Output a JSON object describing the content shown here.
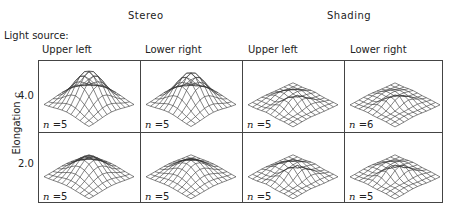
{
  "groups": [
    {
      "title": "Stereo"
    },
    {
      "title": "Shading"
    }
  ],
  "light_source_label": "Light source:",
  "columns": [
    {
      "label": "Upper left",
      "group": "Stereo"
    },
    {
      "label": "Lower right",
      "group": "Stereo"
    },
    {
      "label": "Upper left",
      "group": "Shading"
    },
    {
      "label": "Lower right",
      "group": "Shading"
    }
  ],
  "y_axis": {
    "label": "Elongation c",
    "label_text": "Elongation ",
    "label_var": "c",
    "rows": [
      "4.0",
      "2.0"
    ]
  },
  "cells": [
    [
      {
        "n": "5",
        "peak": 1.0
      },
      {
        "n": "5",
        "peak": 0.95
      },
      {
        "n": "5",
        "peak": 0.3
      },
      {
        "n": "6",
        "peak": 0.25
      }
    ],
    [
      {
        "n": "5",
        "peak": 0.6
      },
      {
        "n": "5",
        "peak": 0.5
      },
      {
        "n": "5",
        "peak": 0.35
      },
      {
        "n": "5",
        "peak": 0.3
      }
    ]
  ],
  "n_prefix": "n",
  "n_eq": " =",
  "colors": {
    "line": "#333333",
    "border": "#444444"
  }
}
